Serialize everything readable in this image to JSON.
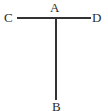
{
  "figure": {
    "kind": "geometry-line-diagram",
    "background_color": "#ffffff",
    "stroke_color": "#333333",
    "label_color": "#2b2b2b",
    "stroke_width": 2,
    "canvas": {
      "width": 108,
      "height": 111
    },
    "points": {
      "A": {
        "label": "A",
        "x": 56,
        "y": 18
      },
      "B": {
        "label": "B",
        "x": 56,
        "y": 100
      },
      "C": {
        "label": "C",
        "x": 17,
        "y": 18
      },
      "D": {
        "label": "D",
        "x": 91,
        "y": 18
      }
    },
    "segments": [
      {
        "name": "horizontal-segment-cd",
        "from": "C",
        "to": "D",
        "x1": 17,
        "y1": 18,
        "x2": 91,
        "y2": 18
      },
      {
        "name": "vertical-segment-ab",
        "from": "A",
        "to": "B",
        "x1": 56,
        "y1": 18,
        "x2": 56,
        "y2": 100
      }
    ],
    "labels": {
      "a": "A",
      "b": "B",
      "c": "C",
      "d": "D"
    }
  }
}
